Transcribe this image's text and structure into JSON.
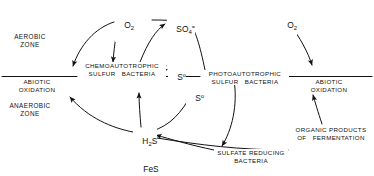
{
  "figure": {
    "type": "sulfur-cycle-diagram",
    "background_color": "#ffffff",
    "line_color": "#111111",
    "text_color": "#111111"
  },
  "zones": {
    "aerobic": "AEROBIC\nZONE",
    "anaerobic": "ANAEROBIC\nZONE"
  },
  "boundary": {
    "name": "aerobic-anaerobic-interface-line"
  },
  "nodes": {
    "o2_left": "O2",
    "o2_right": "O2",
    "sulfate": "SO4",
    "sulfur_upper": "S",
    "sulfur_lower": "S",
    "h2s": "H2S",
    "fes": "FeS",
    "abiotic_oxidation_left": "ABIOTIC\nOXIDATION",
    "abiotic_oxidation_right": "ABIOTIC\nOXIDATION",
    "chemoautotrophic": "CHEMOAUTOTROPHIC\nSULFUR   BACTERIA",
    "photoautotrophic": "PHOTOAUTOTROPHIC\nSULFUR   BACTERIA",
    "sulfate_reducing": "SULFATE REDUCING\nBACTERIA",
    "organic_products": "ORGANIC PRODUCTS\nOF   FERMENTATION"
  },
  "chem_html": {
    "o2": "O<sub>2</sub>",
    "sulfate": "SO<sub>4</sub><sup>=</sup>",
    "sulfur": "S<sup>o</sup>",
    "h2s": "H<sub>2</sub>S",
    "fes": "FeS"
  },
  "chart_data": {
    "type": "diagram",
    "title": "",
    "edges": [
      {
        "from": "O2",
        "to": "ABIOTIC OXIDATION (left)"
      },
      {
        "from": "O2",
        "to": "CHEMOAUTOTROPHIC SULFUR BACTERIA"
      },
      {
        "from": "CHEMOAUTOTROPHIC SULFUR BACTERIA",
        "to": "SO4="
      },
      {
        "from": "So",
        "to": "CHEMOAUTOTROPHIC SULFUR BACTERIA"
      },
      {
        "from": "PHOTOAUTOTROPHIC SULFUR BACTERIA",
        "to": "SO4="
      },
      {
        "from": "So",
        "to": "PHOTOAUTOTROPHIC SULFUR BACTERIA"
      },
      {
        "from": "O2",
        "to": "ABIOTIC OXIDATION (right)"
      },
      {
        "from": "H2S",
        "to": "ABIOTIC OXIDATION (left)"
      },
      {
        "from": "H2S",
        "to": "CHEMOAUTOTROPHIC SULFUR BACTERIA"
      },
      {
        "from": "H2S",
        "to": "PHOTOAUTOTROPHIC SULFUR BACTERIA"
      },
      {
        "from": "FeS",
        "to": "H2S"
      },
      {
        "from": "SULFATE REDUCING BACTERIA",
        "to": "H2S"
      },
      {
        "from": "SO4=",
        "to": "SULFATE REDUCING BACTERIA"
      },
      {
        "from": "ORGANIC PRODUCTS OF FERMENTATION",
        "to": "ABIOTIC OXIDATION (right)"
      }
    ]
  }
}
